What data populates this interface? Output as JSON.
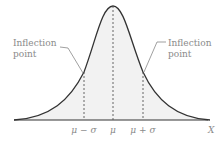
{
  "diagram": {
    "type": "normal-distribution-curve",
    "annotations": [
      {
        "text_line1": "Inflection",
        "text_line2": "point",
        "side": "left"
      },
      {
        "text_line1": "Inflection",
        "text_line2": "point",
        "side": "right"
      }
    ],
    "axis": {
      "ticks": [
        "μ − σ",
        "μ",
        "μ + σ"
      ],
      "variable_label": "X"
    },
    "colors": {
      "curve": "#333333",
      "fill": "#f2f2f2",
      "dashed_lines": "#555555",
      "label_text": "#8a8a8a"
    }
  }
}
